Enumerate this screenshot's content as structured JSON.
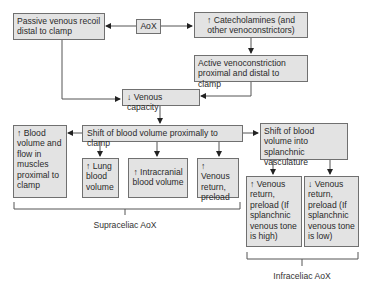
{
  "nodes": {
    "aox": "AoX",
    "passive_recoil": "Passive venous recoil distal to clamp",
    "catecholamines": "↑ Catecholamines (and other venoconstrictors)",
    "active_venoconstriction": "Active venoconstriction proximal and distal to clamp",
    "venous_capacity": "↓ Venous capacity",
    "shift_proximal": "Shift of blood volume proximally to clamp",
    "shift_splanchnic": "Shift of blood volume into splanchnic vasculature",
    "muscle_blood_volume": "↑ Blood volume and flow in muscles proximal to clamp",
    "lung_blood_volume": "↑ Lung blood volume",
    "intracranial_blood_volume": "↑ Intracranial blood volume",
    "venous_return_preload": "↑ Venous return, preload",
    "venous_return_high_tone": "↑ Venous return, preload (If splanchnic venous tone is high)",
    "venous_return_low_tone": "↓ Venous return, preload (If splanchnic venous tone is low)"
  },
  "groups": {
    "supraceliac": "Supraceliac AoX",
    "infraceliac": "Infraceliac AoX"
  }
}
